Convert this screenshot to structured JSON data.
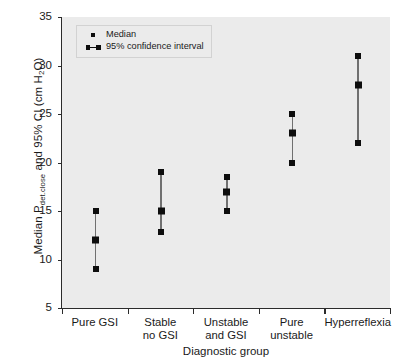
{
  "chart_data": {
    "type": "scatter",
    "title": "",
    "xlabel": "Diagnostic group",
    "ylabel": "Median Pdet.close and 95% CI (cm H2O)",
    "ylabel_parts": {
      "prefix": "Median P",
      "subscript": "det.close",
      "middle": " and 95% CI (cm H",
      "sub2": "2",
      "suffix": "O)"
    },
    "categories": [
      "Pure GSI",
      "Stable no GSI",
      "Unstable and GSI",
      "Pure unstable",
      "Hyperreflexia"
    ],
    "category_lines": [
      [
        "Pure GSI"
      ],
      [
        "Stable",
        "no GSI"
      ],
      [
        "Unstable",
        "and GSI"
      ],
      [
        "Pure",
        "unstable"
      ],
      [
        "Hyperreflexia"
      ]
    ],
    "series": [
      {
        "name": "Median",
        "values": [
          12,
          15,
          17,
          23,
          28
        ]
      },
      {
        "name": "95% CI lower",
        "values": [
          9,
          12.8,
          15,
          20,
          22
        ]
      },
      {
        "name": "95% CI upper",
        "values": [
          15,
          19,
          18.5,
          25,
          31
        ]
      }
    ],
    "points": [
      {
        "category": "Pure GSI",
        "median": 12,
        "ci_low": 9,
        "ci_high": 15
      },
      {
        "category": "Stable no GSI",
        "median": 15,
        "ci_low": 12.8,
        "ci_high": 19
      },
      {
        "category": "Unstable and GSI",
        "median": 17,
        "ci_low": 15,
        "ci_high": 18.5
      },
      {
        "category": "Pure unstable",
        "median": 23,
        "ci_low": 20,
        "ci_high": 25
      },
      {
        "category": "Hyperreflexia",
        "median": 28,
        "ci_low": 22,
        "ci_high": 31
      }
    ],
    "ylim": [
      5,
      35
    ],
    "yticks": [
      5,
      10,
      15,
      20,
      25,
      30,
      35
    ],
    "ytick_labels": [
      "5",
      "10",
      "15",
      "20",
      "25",
      "30",
      "35"
    ],
    "grid": false,
    "legend_position": "top-left",
    "legend": [
      {
        "label": "Median",
        "marker": "dot"
      },
      {
        "label": "95% confidence interval",
        "marker": "dot-line-dot"
      }
    ],
    "colors": {
      "plot_background": "#ebebeb",
      "marker": "#0d0d0d",
      "ci_line": "#707070",
      "axis": "#2b2b2b",
      "text": "#1a1a1a"
    }
  }
}
